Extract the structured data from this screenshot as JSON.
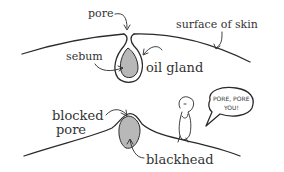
{
  "diagram": {
    "top_panel": {
      "labels": {
        "pore": "pore",
        "surface": "surface of skin",
        "sebum": "sebum",
        "oil_gland": "oil gland"
      }
    },
    "bottom_panel": {
      "labels": {
        "blocked_line1": "blocked",
        "blocked_line2": "pore",
        "blackhead": "blackhead"
      },
      "speech_bubble": {
        "line1": "PORE, PORE",
        "line2": "YOU!"
      }
    },
    "colors": {
      "ink": "#2a2a2a",
      "sebum_fill": "#b8b8b8",
      "background": "#ffffff"
    }
  }
}
